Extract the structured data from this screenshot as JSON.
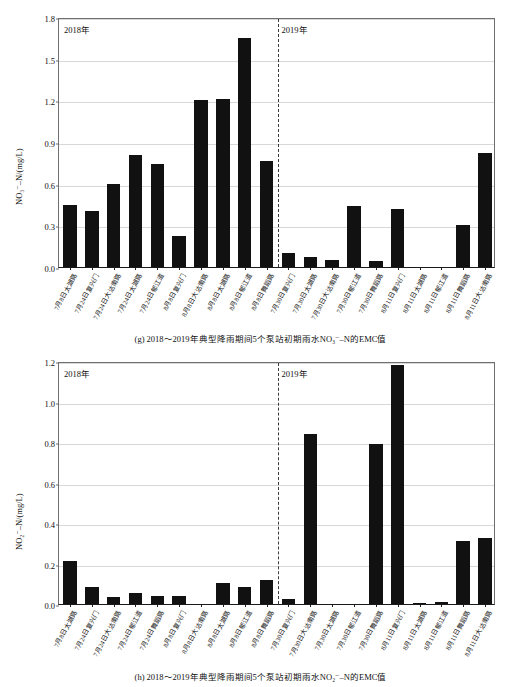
{
  "page": {
    "background": "#ffffff",
    "bar_color": "#111111",
    "grid_color": "#d8d8d8",
    "axis_color": "#6f6f6f"
  },
  "figures": [
    {
      "id": "g",
      "caption": "(g) 2018～2019年典型降雨期间5个泵站初期雨水NO₃⁻–N的EMC值",
      "year_left": "2018年",
      "year_right": "2019年"
    },
    {
      "id": "h",
      "caption": "(h) 2018～2019年典型降雨期间5个泵站初期雨水NO₂⁻–N的EMC值",
      "year_left": "2018年",
      "year_right": "2019年"
    }
  ],
  "chart_data": [
    {
      "type": "bar",
      "title": "(g) 2018～2019年典型降雨期间5个泵站初期雨水NO₃⁻–N的EMC值",
      "xlabel": "",
      "ylabel": "NO₃⁻–N/(mg/L)",
      "ylim": [
        0,
        1.8
      ],
      "yticks": [
        0.0,
        0.3,
        0.6,
        0.9,
        1.2,
        1.5,
        1.8
      ],
      "ytick_labels": [
        "0.0",
        "0.3",
        "0.6",
        "0.9",
        "1.2",
        "1.5",
        "1.8"
      ],
      "grid": true,
      "legend": "none",
      "annotations": [
        {
          "text": "2018年",
          "position": "top-left"
        },
        {
          "text": "2019年",
          "position": "top-right-of-divider"
        }
      ],
      "divider_after_index": 9,
      "categories": [
        "7月8日太湖路",
        "7月24日复兴门",
        "7月24日大沽南路",
        "7月24日太湖路",
        "7月24日郁江道",
        "8月8日复兴门",
        "8月8日大沽南路",
        "8月8日太湖路",
        "8月8日郁江道",
        "8月8日舞蹈路",
        "7月30日复兴门",
        "7月30日太湖路",
        "7月30日大沽南路",
        "7月30日郁江道",
        "7月30日舞蹈路",
        "8月11日复兴门",
        "8月11日太湖路",
        "8月11日郁江道",
        "8月11日舞蹈路",
        "8月11日大沽南路"
      ],
      "values": [
        0.45,
        0.4,
        0.6,
        0.81,
        0.74,
        0.22,
        1.2,
        1.21,
        1.65,
        0.76,
        0.1,
        0.07,
        0.05,
        0.44,
        0.04,
        0.42,
        0.0,
        0.0,
        0.3,
        0.82
      ]
    },
    {
      "type": "bar",
      "title": "(h) 2018～2019年典型降雨期间5个泵站初期雨水NO₂⁻–N的EMC值",
      "xlabel": "",
      "ylabel": "NO₂⁻–N/(mg/L)",
      "ylim": [
        0,
        1.2
      ],
      "yticks": [
        0.0,
        0.2,
        0.4,
        0.6,
        0.8,
        1.0,
        1.2
      ],
      "ytick_labels": [
        "0.0",
        "0.2",
        "0.4",
        "0.6",
        "0.8",
        "1.0",
        "1.2"
      ],
      "grid": true,
      "legend": "none",
      "annotations": [
        {
          "text": "2018年",
          "position": "top-left"
        },
        {
          "text": "2019年",
          "position": "top-right-of-divider"
        }
      ],
      "divider_after_index": 9,
      "categories": [
        "7月8日太湖路",
        "7月24日复兴门",
        "7月24日大沽南路",
        "7月24日郁江道",
        "7月24日舞蹈路",
        "8月8日复兴门",
        "8月8日大沽南路",
        "8月8日太湖路",
        "8月8日郁江道",
        "8月8日舞蹈路",
        "7月30日复兴门",
        "7月30日大沽南路",
        "7月30日太湖路",
        "7月30日郁江道",
        "7月30日舞蹈路",
        "8月11日复兴门",
        "8月11日太湖路",
        "8月11日郁江道",
        "8月11日舞蹈路",
        "8月11日大沽南路"
      ],
      "values": [
        0.21,
        0.085,
        0.035,
        0.055,
        0.04,
        0.04,
        0.0,
        0.105,
        0.085,
        0.12,
        0.025,
        0.84,
        0.0,
        0.0,
        0.79,
        1.18,
        0.005,
        0.01,
        0.31,
        0.325
      ]
    }
  ]
}
